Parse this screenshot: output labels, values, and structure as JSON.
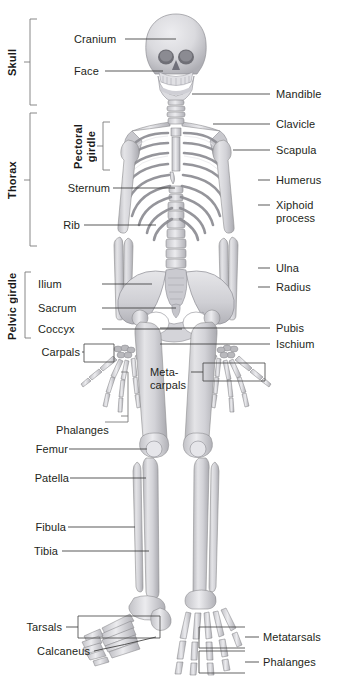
{
  "figure": {
    "background_color": "#ffffff",
    "label_color": "#231f20",
    "leader_line_color": "#3b3b3b",
    "bone_fill_color": "#d6d6da"
  },
  "group_brackets": [
    {
      "name": "skull",
      "label": "Skull"
    },
    {
      "name": "thorax",
      "label": "Thorax"
    },
    {
      "name": "pelvic-girdle",
      "label": "Pelvic girdle"
    },
    {
      "name": "pectoral-girdle",
      "label": "Pectoral\ngirdle",
      "line1": "Pectoral",
      "line2": "girdle"
    }
  ],
  "labels_left": [
    {
      "name": "cranium",
      "text": "Cranium"
    },
    {
      "name": "face",
      "text": "Face"
    },
    {
      "name": "sternum",
      "text": "Sternum"
    },
    {
      "name": "rib",
      "text": "Rib"
    },
    {
      "name": "ilium",
      "text": "Ilium"
    },
    {
      "name": "sacrum",
      "text": "Sacrum"
    },
    {
      "name": "coccyx",
      "text": "Coccyx"
    },
    {
      "name": "carpals",
      "text": "Carpals"
    },
    {
      "name": "phalanges-hand",
      "text": "Phalanges"
    },
    {
      "name": "femur",
      "text": "Femur"
    },
    {
      "name": "patella",
      "text": "Patella"
    },
    {
      "name": "fibula",
      "text": "Fibula"
    },
    {
      "name": "tibia",
      "text": "Tibia"
    },
    {
      "name": "tarsals",
      "text": "Tarsals"
    },
    {
      "name": "calcaneus",
      "text": "Calcaneus"
    }
  ],
  "labels_right": [
    {
      "name": "mandible",
      "text": "Mandible"
    },
    {
      "name": "clavicle",
      "text": "Clavicle"
    },
    {
      "name": "scapula",
      "text": "Scapula"
    },
    {
      "name": "humerus",
      "text": "Humerus"
    },
    {
      "name": "xiphoid-process",
      "text": "Xiphoid\nprocess",
      "line1": "Xiphoid",
      "line2": "process"
    },
    {
      "name": "ulna",
      "text": "Ulna"
    },
    {
      "name": "radius",
      "text": "Radius"
    },
    {
      "name": "pubis",
      "text": "Pubis"
    },
    {
      "name": "ischium",
      "text": "Ischium"
    },
    {
      "name": "metatarsals",
      "text": "Metatarsals"
    },
    {
      "name": "phalanges-foot",
      "text": "Phalanges"
    }
  ],
  "labels_center": [
    {
      "name": "metacarpals",
      "text": "Meta-\ncarpals",
      "line1": "Meta-",
      "line2": "carpals"
    }
  ]
}
